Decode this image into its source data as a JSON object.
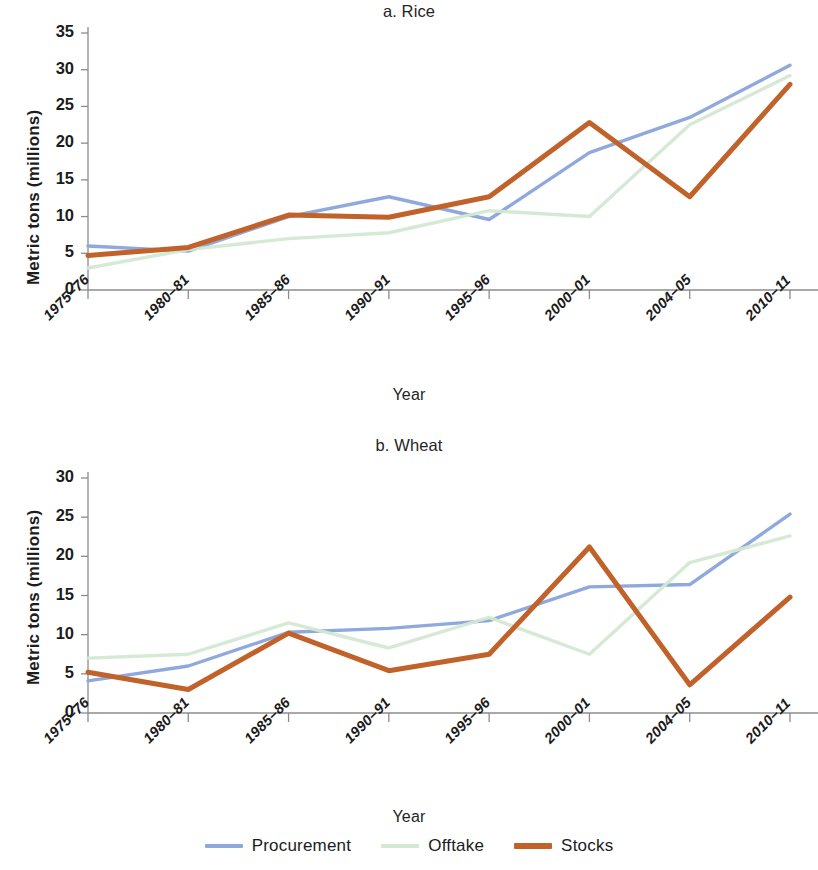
{
  "figure": {
    "legend": {
      "items": [
        {
          "label": "Procurement",
          "color": "#8FA9DC"
        },
        {
          "label": "Offtake",
          "color": "#D3E8D3"
        },
        {
          "label": "Stocks",
          "color": "#C0622A"
        }
      ]
    }
  },
  "chart_data": [
    {
      "type": "line",
      "title": "a. Rice",
      "xlabel": "Year",
      "ylabel": "Metric tons (millions)",
      "categories": [
        "1975–76",
        "1980–81",
        "1985–86",
        "1990–91",
        "1995–96",
        "2000–01",
        "2004–05",
        "2010–11"
      ],
      "ylim": [
        0,
        35
      ],
      "yticks": [
        0,
        5,
        10,
        15,
        20,
        25,
        30,
        35
      ],
      "grid": false,
      "legend_position": "bottom",
      "series": [
        {
          "name": "Procurement",
          "color": "#8FA9DC",
          "values": [
            6.0,
            5.3,
            10.0,
            12.7,
            9.6,
            18.7,
            23.5,
            30.6
          ]
        },
        {
          "name": "Offtake",
          "color": "#D3E8D3",
          "values": [
            3.0,
            5.5,
            7.0,
            7.8,
            10.8,
            10.0,
            22.5,
            29.2
          ]
        },
        {
          "name": "Stocks",
          "color": "#C0622A",
          "values": [
            4.7,
            5.8,
            10.2,
            9.9,
            12.7,
            22.8,
            12.7,
            28.0
          ]
        }
      ]
    },
    {
      "type": "line",
      "title": "b. Wheat",
      "xlabel": "Year",
      "ylabel": "Metric tons (millions)",
      "categories": [
        "1975–76",
        "1980–81",
        "1985–86",
        "1990–91",
        "1995–96",
        "2000–01",
        "2004–05",
        "2010–11"
      ],
      "ylim": [
        0,
        30
      ],
      "yticks": [
        0,
        5,
        10,
        15,
        20,
        25,
        30
      ],
      "grid": false,
      "legend_position": "bottom",
      "series": [
        {
          "name": "Procurement",
          "color": "#8FA9DC",
          "values": [
            4.1,
            6.0,
            10.3,
            10.8,
            11.8,
            16.1,
            16.4,
            25.4
          ]
        },
        {
          "name": "Offtake",
          "color": "#D3E8D3",
          "values": [
            7.0,
            7.5,
            11.5,
            8.3,
            12.2,
            7.5,
            19.2,
            22.6
          ]
        },
        {
          "name": "Stocks",
          "color": "#C0622A",
          "values": [
            5.2,
            3.0,
            10.2,
            5.4,
            7.5,
            21.2,
            3.6,
            14.8
          ]
        }
      ]
    }
  ]
}
